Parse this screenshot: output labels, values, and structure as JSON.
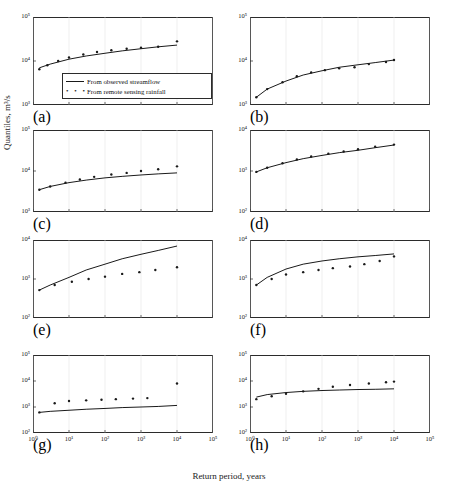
{
  "figure": {
    "ylabel": "Quantiles, m³/s",
    "xlabel": "Return period, years",
    "legend": {
      "line_label": "From observed streamflow",
      "dots_label": "From remote sensing rainfall",
      "dots_glyph": "• • •"
    }
  },
  "chart_data": [
    {
      "type": "line",
      "panel": "(a)",
      "title": "",
      "xlabel": "Return period, years",
      "ylabel": "Quantiles, m³/s",
      "xscale": "log",
      "yscale": "log",
      "xlim": [
        1,
        100000
      ],
      "ylim": [
        1000,
        100000
      ],
      "xticks": [
        "10⁰",
        "10¹",
        "10²",
        "10³",
        "10⁴",
        "10⁵"
      ],
      "yticks": [
        "10³",
        "10⁴",
        "10⁵"
      ],
      "grid": false,
      "series": [
        {
          "name": "From observed streamflow",
          "style": "line",
          "x": [
            1.5,
            3,
            10,
            30,
            100,
            300,
            1000,
            3000,
            10000
          ],
          "y": [
            7000,
            8500,
            11000,
            13000,
            15000,
            17000,
            19000,
            21000,
            23000
          ]
        },
        {
          "name": "From remote sensing rainfall",
          "style": "dots",
          "x": [
            1.5,
            2.5,
            5,
            10,
            25,
            60,
            150,
            400,
            1000,
            3000,
            10000
          ],
          "y": [
            6500,
            8000,
            10000,
            12000,
            14000,
            16000,
            17500,
            19000,
            20000,
            21000,
            28000
          ]
        }
      ]
    },
    {
      "type": "line",
      "panel": "(b)",
      "xscale": "log",
      "yscale": "log",
      "xlim": [
        1,
        100000
      ],
      "ylim": [
        1000,
        100000
      ],
      "xticks": [
        "10⁰",
        "10¹",
        "10²",
        "10³",
        "10⁴",
        "10⁵"
      ],
      "yticks": [
        "10³",
        "10⁴",
        "10⁵"
      ],
      "grid": false,
      "series": [
        {
          "name": "From observed streamflow",
          "style": "line",
          "x": [
            1.5,
            3,
            10,
            30,
            100,
            300,
            1000,
            3000,
            10000
          ],
          "y": [
            1500,
            2300,
            3500,
            4800,
            6000,
            7200,
            8200,
            9200,
            10500
          ]
        },
        {
          "name": "From remote sensing rainfall",
          "style": "dots",
          "x": [
            1.5,
            3,
            8,
            20,
            50,
            120,
            300,
            800,
            2000,
            6000,
            10000
          ],
          "y": [
            1500,
            2300,
            3300,
            4500,
            5500,
            6200,
            6800,
            7200,
            8500,
            9500,
            10500
          ]
        }
      ]
    },
    {
      "type": "line",
      "panel": "(c)",
      "xscale": "log",
      "yscale": "log",
      "xlim": [
        1,
        100000
      ],
      "ylim": [
        1000,
        100000
      ],
      "xticks": [
        "10⁰",
        "10¹",
        "10²",
        "10³",
        "10⁴",
        "10⁵"
      ],
      "yticks": [
        "10³",
        "10⁴",
        "10⁵"
      ],
      "grid": false,
      "series": [
        {
          "name": "From observed streamflow",
          "style": "line",
          "x": [
            1.5,
            3,
            10,
            30,
            100,
            300,
            1000,
            3000,
            10000
          ],
          "y": [
            3500,
            4200,
            5200,
            6000,
            6800,
            7400,
            8000,
            8500,
            9000
          ]
        },
        {
          "name": "From remote sensing rainfall",
          "style": "dots",
          "x": [
            1.5,
            3,
            8,
            20,
            50,
            150,
            400,
            1000,
            3000,
            10000
          ],
          "y": [
            3500,
            4200,
            5200,
            6200,
            7200,
            8200,
            9000,
            10000,
            11000,
            13000
          ]
        }
      ]
    },
    {
      "type": "line",
      "panel": "(d)",
      "xscale": "log",
      "yscale": "log",
      "xlim": [
        1,
        100000
      ],
      "ylim": [
        100,
        10000
      ],
      "xticks": [
        "10⁰",
        "10¹",
        "10²",
        "10³",
        "10⁴",
        "10⁵"
      ],
      "yticks": [
        "10²",
        "10³",
        "10⁴"
      ],
      "grid": false,
      "series": [
        {
          "name": "From observed streamflow",
          "style": "line",
          "x": [
            1.5,
            3,
            10,
            30,
            100,
            300,
            1000,
            3000,
            10000
          ],
          "y": [
            950,
            1200,
            1600,
            2000,
            2400,
            2800,
            3200,
            3700,
            4300
          ]
        },
        {
          "name": "From remote sensing rainfall",
          "style": "dots",
          "x": [
            1.5,
            3,
            8,
            20,
            50,
            150,
            400,
            1000,
            3000,
            10000
          ],
          "y": [
            950,
            1200,
            1550,
            1900,
            2250,
            2650,
            3000,
            3400,
            3900,
            4400
          ]
        }
      ]
    },
    {
      "type": "line",
      "panel": "(e)",
      "xscale": "log",
      "yscale": "log",
      "xlim": [
        1,
        100000
      ],
      "ylim": [
        100,
        10000
      ],
      "xticks": [
        "10⁰",
        "10¹",
        "10²",
        "10³",
        "10⁴",
        "10⁵"
      ],
      "yticks": [
        "10²",
        "10³",
        "10⁴"
      ],
      "grid": false,
      "series": [
        {
          "name": "From observed streamflow",
          "style": "line",
          "x": [
            1.5,
            3,
            10,
            30,
            100,
            300,
            1000,
            3000,
            10000
          ],
          "y": [
            520,
            700,
            1100,
            1700,
            2400,
            3300,
            4300,
            5400,
            7000
          ]
        },
        {
          "name": "From remote sensing rainfall",
          "style": "dots",
          "x": [
            1.5,
            4,
            12,
            35,
            100,
            300,
            900,
            2500,
            10000
          ],
          "y": [
            520,
            700,
            850,
            1000,
            1150,
            1350,
            1500,
            1700,
            2000
          ]
        }
      ]
    },
    {
      "type": "line",
      "panel": "(f)",
      "xscale": "log",
      "yscale": "log",
      "xlim": [
        1,
        100000
      ],
      "ylim": [
        100,
        10000
      ],
      "xticks": [
        "10⁰",
        "10¹",
        "10²",
        "10³",
        "10⁴",
        "10⁵"
      ],
      "yticks": [
        "10²",
        "10³",
        "10⁴"
      ],
      "grid": false,
      "series": [
        {
          "name": "From observed streamflow",
          "style": "line",
          "x": [
            1.5,
            3,
            10,
            30,
            100,
            300,
            1000,
            3000,
            10000
          ],
          "y": [
            700,
            1100,
            1800,
            2400,
            2900,
            3300,
            3700,
            4000,
            4400
          ]
        },
        {
          "name": "From remote sensing rainfall",
          "style": "dots",
          "x": [
            1.5,
            4,
            10,
            30,
            80,
            200,
            600,
            1500,
            4000,
            10000
          ],
          "y": [
            700,
            1000,
            1300,
            1500,
            1700,
            1900,
            2100,
            2400,
            2900,
            3800
          ]
        }
      ]
    },
    {
      "type": "line",
      "panel": "(g)",
      "xscale": "log",
      "yscale": "log",
      "xlim": [
        1,
        100000
      ],
      "ylim": [
        100,
        100000
      ],
      "xticks": [
        "10⁰",
        "10¹",
        "10²",
        "10³",
        "10⁴",
        "10⁵"
      ],
      "yticks": [
        "10²",
        "10³",
        "10⁴",
        "10⁵"
      ],
      "grid": false,
      "series": [
        {
          "name": "From observed streamflow",
          "style": "line",
          "x": [
            1.5,
            3,
            10,
            30,
            100,
            300,
            1000,
            3000,
            10000
          ],
          "y": [
            620,
            680,
            750,
            820,
            880,
            950,
            1000,
            1050,
            1150
          ]
        },
        {
          "name": "From remote sensing rainfall",
          "style": "dots",
          "x": [
            1.5,
            4,
            10,
            30,
            80,
            200,
            600,
            1500,
            10000
          ],
          "y": [
            620,
            1400,
            1700,
            1800,
            1900,
            2000,
            2100,
            2200,
            8000
          ]
        }
      ]
    },
    {
      "type": "line",
      "panel": "(h)",
      "xscale": "log",
      "yscale": "log",
      "xlim": [
        1,
        100000
      ],
      "ylim": [
        100,
        100000
      ],
      "xticks": [
        "10⁰",
        "10¹",
        "10²",
        "10³",
        "10⁴",
        "10⁵"
      ],
      "yticks": [
        "10²",
        "10³",
        "10⁴",
        "10⁵"
      ],
      "grid": false,
      "series": [
        {
          "name": "From observed streamflow",
          "style": "line",
          "x": [
            1.5,
            3,
            10,
            30,
            100,
            300,
            1000,
            3000,
            10000
          ],
          "y": [
            2400,
            3000,
            3600,
            4000,
            4300,
            4500,
            4700,
            4800,
            5000
          ]
        },
        {
          "name": "From remote sensing rainfall",
          "style": "dots",
          "x": [
            1.5,
            4,
            10,
            30,
            80,
            200,
            600,
            2000,
            6000,
            10000
          ],
          "y": [
            2000,
            2600,
            3200,
            4000,
            5000,
            6000,
            7000,
            8000,
            9000,
            9500
          ]
        }
      ]
    }
  ]
}
